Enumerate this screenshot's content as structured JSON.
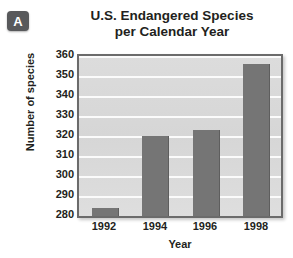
{
  "badge": {
    "label": "A"
  },
  "chart_data": {
    "type": "bar",
    "title": "U.S. Endangered Species per Calendar Year",
    "title_lines": [
      "U.S. Endangered Species",
      "per Calendar Year"
    ],
    "xlabel": "Year",
    "ylabel": "Number of species",
    "categories": [
      "1992",
      "1994",
      "1996",
      "1998"
    ],
    "values": [
      284,
      320,
      323,
      356
    ],
    "series": [
      {
        "name": "Number of species",
        "values": [
          284,
          320,
          323,
          356
        ]
      }
    ],
    "ylim": [
      280,
      360
    ],
    "ytick_labels": [
      "360",
      "350",
      "340",
      "330",
      "320",
      "310",
      "300",
      "290",
      "280"
    ],
    "ytick_values": [
      360,
      350,
      340,
      330,
      320,
      310,
      300,
      290,
      280
    ],
    "grid": true,
    "legend": false,
    "colors": {
      "bar": "#757575",
      "plot_background": "#dcdcdc",
      "gridline": "#fbfbfb",
      "axis_border": "#6b6b6b",
      "text": "#231f20",
      "badge_background": "#58595b"
    }
  }
}
